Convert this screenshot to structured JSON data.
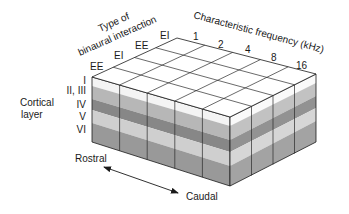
{
  "diagram": {
    "top_axis_binaural": {
      "label_line1": "Type of",
      "label_line2": "binaural interaction",
      "ticks": [
        "EE",
        "EI",
        "EE",
        "EI"
      ]
    },
    "top_axis_frequency": {
      "label": "Characteristic frequency (kHz)",
      "ticks": [
        "1",
        "2",
        "4",
        "8",
        "16"
      ]
    },
    "depth_axis": {
      "label_line1": "Cortical",
      "label_line2": "layer",
      "layers": [
        "I",
        "II, III",
        "IV",
        "V",
        "VI"
      ]
    },
    "direction_arrow": {
      "start_label": "Rostral",
      "end_label": "Caudal"
    },
    "colors": {
      "top_face": "#ffffff",
      "layer_I": "#f4f4f4",
      "layer_II_III": "#b8b8b8",
      "layer_IV": "#8a8a8a",
      "layer_V": "#cfcfcf",
      "layer_VI": "#9a9a9a",
      "lines": "#1a1a1a"
    }
  }
}
